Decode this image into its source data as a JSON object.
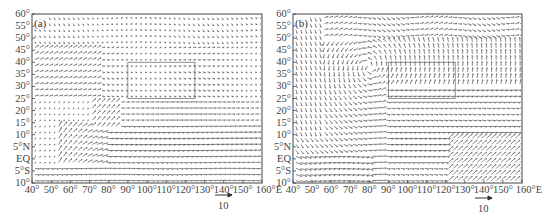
{
  "figure": {
    "panels": [
      {
        "id": "a",
        "label": "(a)",
        "left": 32,
        "top": 14,
        "width": 230,
        "height": 169,
        "ref_arrow": {
          "x1": 215,
          "x2": 232,
          "y": 195,
          "label": "10",
          "label_x": 218,
          "label_y": 200
        },
        "box": {
          "lon0": 90,
          "lon1": 125,
          "lat0": 25,
          "lat1": 40
        }
      },
      {
        "id": "b",
        "label": "(b)",
        "left": 293,
        "top": 14,
        "width": 229,
        "height": 169,
        "ref_arrow": {
          "x1": 475,
          "x2": 492,
          "y": 198,
          "label": "10",
          "label_x": 478,
          "label_y": 203
        },
        "box": {
          "lon0": 90,
          "lon1": 125,
          "lat0": 25,
          "lat1": 40
        }
      }
    ],
    "y_ticks": [
      "60°",
      "55°",
      "50°",
      "45°",
      "40°",
      "35°",
      "30°",
      "25°",
      "20°",
      "15°",
      "10°",
      "5°N",
      "EQ",
      "5°S",
      "10°"
    ],
    "x_ticks": [
      "40°",
      "50°",
      "60°",
      "70°",
      "80°",
      "90°",
      "100°",
      "110°",
      "120°",
      "130°",
      "140°",
      "150°",
      "160°E"
    ]
  },
  "chart_data": [
    {
      "type": "quiver",
      "title": "(a)",
      "xlabel": "Longitude",
      "ylabel": "Latitude",
      "xlim": [
        40,
        160
      ],
      "ylim": [
        -10,
        60
      ],
      "x_ticks": [
        "40°",
        "50°",
        "60°",
        "70°",
        "80°",
        "90°",
        "100°",
        "110°",
        "120°",
        "130°",
        "140°",
        "150°",
        "160°E"
      ],
      "y_ticks": [
        "60°",
        "55°",
        "50°",
        "45°",
        "40°",
        "35°",
        "30°",
        "25°",
        "20°",
        "15°",
        "10°",
        "5°N",
        "EQ",
        "5°S",
        "10°"
      ],
      "reference_vector": {
        "magnitude": 10,
        "label": "10"
      },
      "grid": false,
      "description": "Wind vector field: strong westerlies 0-15°N from ~75°E eastward; cross-equatorial flow near 60-75°E (Somali jet); weak flow north of 40°N; rectangular box over ~90-125°E, 25-40°N",
      "flow_regions": [
        {
          "lon": [
            40,
            70
          ],
          "lat": [
            30,
            45
          ],
          "u": 4,
          "v": 3
        },
        {
          "lon": [
            75,
            160
          ],
          "lat": [
            0,
            15
          ],
          "u": 10,
          "v": 0
        },
        {
          "lon": [
            55,
            75
          ],
          "lat": [
            -10,
            10
          ],
          "u": 3,
          "v": 6
        },
        {
          "lon": [
            40,
            160
          ],
          "lat": [
            45,
            60
          ],
          "u": 1,
          "v": -1
        }
      ]
    },
    {
      "type": "quiver",
      "title": "(b)",
      "xlabel": "Longitude",
      "ylabel": "Latitude",
      "xlim": [
        40,
        160
      ],
      "ylim": [
        -10,
        60
      ],
      "x_ticks": [
        "40°",
        "50°",
        "60°",
        "70°",
        "80°",
        "90°",
        "100°",
        "110°",
        "120°",
        "130°",
        "140°",
        "150°",
        "160°E"
      ],
      "y_ticks": [
        "60°",
        "55°",
        "50°",
        "45°",
        "40°",
        "35°",
        "30°",
        "25°",
        "20°",
        "15°",
        "10°",
        "5°N",
        "EQ",
        "5°S",
        "10°"
      ],
      "reference_vector": {
        "magnitude": 10,
        "label": "10"
      },
      "grid": false,
      "description": "Wind vector field with strong curved flows: large cyclonic/anticyclonic curvature around 70-90°E at 30-55°N; strong southwesterlies in SE corner 125-160°E, 10°S-10°N; westerlies 20-35°N east of 90°E",
      "flow_regions": [
        {
          "lon": [
            55,
            80
          ],
          "lat": [
            20,
            50
          ],
          "u": -2,
          "v": -6
        },
        {
          "lon": [
            90,
            160
          ],
          "lat": [
            20,
            35
          ],
          "u": 8,
          "v": 0
        },
        {
          "lon": [
            125,
            160
          ],
          "lat": [
            -10,
            10
          ],
          "u": 6,
          "v": 6
        },
        {
          "lon": [
            40,
            70
          ],
          "lat": [
            -10,
            5
          ],
          "u": 8,
          "v": -1
        }
      ]
    }
  ]
}
